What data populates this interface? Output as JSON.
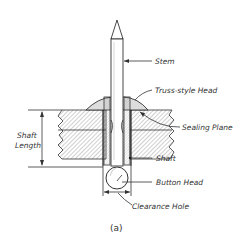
{
  "figure": {
    "caption": "(a)"
  },
  "labels": {
    "stem": "Stem",
    "truss_head": "Truss-style Head",
    "sealing_plane": "Sealing Plane",
    "shaft": "Shaft",
    "button_head": "Button Head",
    "clearance_hole": "Clearance Hole",
    "shaft_length_line1": "Shaft",
    "shaft_length_line2": "Length"
  },
  "colors": {
    "line": "#333333",
    "hatch": "#888888",
    "head_fill": "#dddddd",
    "background": "#ffffff"
  }
}
